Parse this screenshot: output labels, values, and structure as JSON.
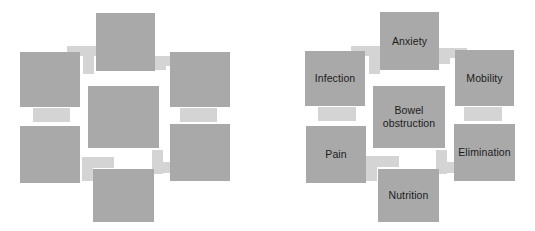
{
  "figure": {
    "type": "concept-map",
    "panels": [
      {
        "id": "unlabeled",
        "name": "blank-template-diagram",
        "has_labels": false
      },
      {
        "id": "labeled",
        "name": "completed-diagram",
        "has_labels": true
      }
    ]
  },
  "colors": {
    "node_fill": "#a9a9a9",
    "connector_fill": "#d4d4d4",
    "background": "#ffffff",
    "text": "#1c1c1c"
  },
  "diagram": {
    "center": {
      "id": "center",
      "label": "Bowel obstruction"
    },
    "nodes": [
      {
        "id": "anxiety",
        "label": "Anxiety"
      },
      {
        "id": "mobility",
        "label": "Mobility"
      },
      {
        "id": "elimination",
        "label": "Elimination"
      },
      {
        "id": "nutrition",
        "label": "Nutrition"
      },
      {
        "id": "pain",
        "label": "Pain"
      },
      {
        "id": "infection",
        "label": "Infection"
      }
    ],
    "connections": [
      {
        "from": "center",
        "to": "anxiety"
      },
      {
        "from": "center",
        "to": "mobility"
      },
      {
        "from": "center",
        "to": "elimination"
      },
      {
        "from": "center",
        "to": "nutrition"
      },
      {
        "from": "center",
        "to": "pain"
      },
      {
        "from": "center",
        "to": "infection"
      },
      {
        "from": "infection",
        "to": "anxiety"
      },
      {
        "from": "anxiety",
        "to": "mobility"
      },
      {
        "from": "mobility",
        "to": "elimination"
      },
      {
        "from": "elimination",
        "to": "nutrition"
      },
      {
        "from": "nutrition",
        "to": "pain"
      },
      {
        "from": "pain",
        "to": "infection"
      }
    ]
  }
}
